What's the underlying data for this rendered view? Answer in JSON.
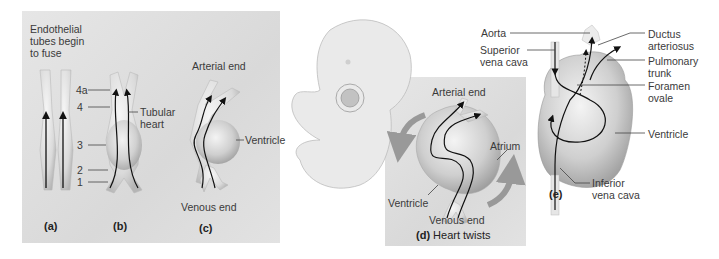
{
  "panel_a": {
    "title": "Endothelial tubes begin to fuse",
    "title_lines": [
      "Endothelial",
      "tubes begin",
      "to fuse"
    ],
    "caption": "(a)"
  },
  "panel_b": {
    "numbers": [
      "4a",
      "4",
      "3",
      "2",
      "1"
    ],
    "label": "Tubular heart",
    "label_lines": [
      "Tubular",
      "heart"
    ],
    "caption": "(b)"
  },
  "panel_c": {
    "top": "Arterial end",
    "side": "Ventricle",
    "bottom": "Venous end",
    "caption": "(c)"
  },
  "panel_d": {
    "top": "Arterial end",
    "atrium": "Atrium",
    "ventricle": "Ventricle",
    "bottom": "Venous end",
    "caption_letter": "(d)",
    "caption_text": "Heart twists"
  },
  "panel_e": {
    "labels_left": [
      {
        "lines": [
          "Aorta"
        ]
      },
      {
        "lines": [
          "Superior",
          "vena cava"
        ]
      }
    ],
    "labels_right": [
      {
        "lines": [
          "Ductus",
          "arteriosus"
        ]
      },
      {
        "lines": [
          "Pulmonary",
          "trunk"
        ]
      },
      {
        "lines": [
          "Foramen",
          "ovale"
        ]
      },
      {
        "lines": [
          "Ventricle"
        ]
      }
    ],
    "bottom_label": [
      "Inferior",
      "vena cava"
    ],
    "caption": "(e)"
  },
  "colors": {
    "panel_bg": "#dcdcdc",
    "tissue": "#e9e9e9",
    "tissue_shadow": "#b8b8b8",
    "arrow": "#111111",
    "twist_arrow": "#9a9a9a"
  }
}
